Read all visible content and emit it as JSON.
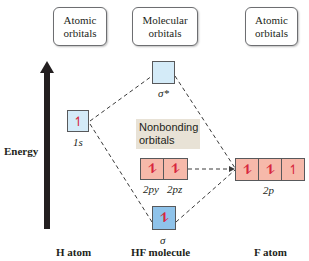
{
  "headers": {
    "h_atomic": "Atomic orbitals",
    "molecular": "Molecular orbitals",
    "f_atomic": "Atomic orbitals"
  },
  "axis": {
    "label": "Energy"
  },
  "orbitals": {
    "h_1s": {
      "electrons": "↿",
      "label": "1s"
    },
    "sigma_star": {
      "electrons": "",
      "label": "σ*"
    },
    "nonbonding": {
      "title": "Nonbonding orbitals",
      "py": "⥮",
      "pz": "⥮",
      "py_label": "2py",
      "pz_label": "2pz"
    },
    "sigma": {
      "electrons": "⥮",
      "label": "σ"
    },
    "f_2p": {
      "b1": "⥮",
      "b2": "⥮",
      "b3": "↿",
      "label": "2p"
    }
  },
  "footer": {
    "h_atom": "H atom",
    "hf_molecule": "HF molecule",
    "f_atom": "F atom"
  },
  "colors": {
    "light_blue": "#d4ebf8",
    "blue": "#8fc3ea",
    "salmon": "#f6b9aa",
    "electron": "#d7263d"
  }
}
